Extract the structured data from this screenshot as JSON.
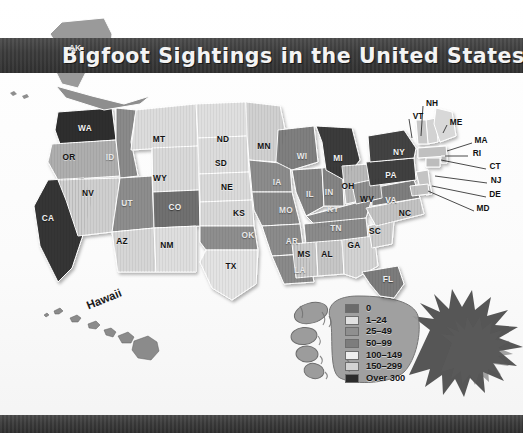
{
  "banner": {
    "title": "Bigfoot Sightings in the United States"
  },
  "insets": {
    "alaska_label": "AK",
    "hawaii_label": "Hawaii"
  },
  "legend": {
    "title": "",
    "items": [
      {
        "label": "0",
        "color": "#6b6b6b"
      },
      {
        "label": "1–24",
        "color": "#e2e2e2"
      },
      {
        "label": "25–49",
        "color": "#8f8f8f"
      },
      {
        "label": "50–99",
        "color": "#7d7d7d"
      },
      {
        "label": "100–149",
        "color": "#efefef"
      },
      {
        "label": "150–299",
        "color": "#d2d2d2"
      },
      {
        "label": "Over 300",
        "color": "#2b2b2b"
      }
    ]
  },
  "chart_data": {
    "type": "map",
    "title": "Bigfoot Sightings in the United States",
    "value_label": "Number of reported Bigfoot sightings",
    "bins": [
      "0",
      "1–24",
      "25–49",
      "50–99",
      "100–149",
      "150–299",
      "Over 300"
    ],
    "bin_colors": [
      "#6b6b6b",
      "#e2e2e2",
      "#8f8f8f",
      "#7d7d7d",
      "#efefef",
      "#d2d2d2",
      "#2b2b2b"
    ],
    "regions": [
      {
        "code": "AK",
        "bin": "25–49",
        "fill": "#9a9a9a",
        "x": 75,
        "y": 48,
        "label_style": "light"
      },
      {
        "code": "WA",
        "bin": "Over 300",
        "fill": "#2f2f2f",
        "x": 85,
        "y": 128,
        "label_style": "light"
      },
      {
        "code": "OR",
        "bin": "150–299",
        "fill": "#aeaeae",
        "x": 69,
        "y": 157,
        "label_style": "dark"
      },
      {
        "code": "CA",
        "bin": "Over 300",
        "fill": "#343434",
        "x": 48,
        "y": 218,
        "label_style": "light"
      },
      {
        "code": "ID",
        "bin": "50–99",
        "fill": "#8a8a8a",
        "x": 110,
        "y": 157,
        "label_style": "mid"
      },
      {
        "code": "NV",
        "bin": "100–149",
        "fill": "#cfcfcf",
        "x": 88,
        "y": 193,
        "label_style": "dark"
      },
      {
        "code": "UT",
        "bin": "50–99",
        "fill": "#8d8d8d",
        "x": 127,
        "y": 203,
        "label_style": "mid"
      },
      {
        "code": "AZ",
        "bin": "100–149",
        "fill": "#d6d6d6",
        "x": 122,
        "y": 241,
        "label_style": "dark"
      },
      {
        "code": "MT",
        "bin": "100–149",
        "fill": "#dcdcdc",
        "x": 159,
        "y": 139,
        "label_style": "dark"
      },
      {
        "code": "WY",
        "bin": "100–149",
        "fill": "#d9d9d9",
        "x": 160,
        "y": 178,
        "label_style": "dark"
      },
      {
        "code": "CO",
        "bin": "50–99",
        "fill": "#6f6f6f",
        "x": 175,
        "y": 207,
        "label_style": "light"
      },
      {
        "code": "NM",
        "bin": "100–149",
        "fill": "#dedede",
        "x": 167,
        "y": 245,
        "label_style": "dark"
      },
      {
        "code": "ND",
        "bin": "100–149",
        "fill": "#dfdfdf",
        "x": 223,
        "y": 139,
        "label_style": "dark"
      },
      {
        "code": "SD",
        "bin": "100–149",
        "fill": "#dcdcdc",
        "x": 221,
        "y": 163,
        "label_style": "dark"
      },
      {
        "code": "NE",
        "bin": "100–149",
        "fill": "#dadada",
        "x": 227,
        "y": 187,
        "label_style": "dark"
      },
      {
        "code": "KS",
        "bin": "100–149",
        "fill": "#d8d8d8",
        "x": 239,
        "y": 213,
        "label_style": "dark"
      },
      {
        "code": "OK",
        "bin": "50–99",
        "fill": "#8e8e8e",
        "x": 248,
        "y": 235,
        "label_style": "mid"
      },
      {
        "code": "TX",
        "bin": "100–149",
        "fill": "#e3e3e3",
        "x": 231,
        "y": 266,
        "label_style": "dark"
      },
      {
        "code": "MN",
        "bin": "100–149",
        "fill": "#d0d0d0",
        "x": 264,
        "y": 146,
        "label_style": "dark"
      },
      {
        "code": "IA",
        "bin": "50–99",
        "fill": "#8c8c8c",
        "x": 277,
        "y": 182,
        "label_style": "mid"
      },
      {
        "code": "MO",
        "bin": "50–99",
        "fill": "#888888",
        "x": 286,
        "y": 210,
        "label_style": "mid"
      },
      {
        "code": "AR",
        "bin": "50–99",
        "fill": "#8b8b8b",
        "x": 292,
        "y": 241,
        "label_style": "mid"
      },
      {
        "code": "LA",
        "bin": "50–99",
        "fill": "#8a8a8a",
        "x": 300,
        "y": 270,
        "label_style": "mid"
      },
      {
        "code": "WI",
        "bin": "50–99",
        "fill": "#7f7f7f",
        "x": 302,
        "y": 156,
        "label_style": "mid"
      },
      {
        "code": "IL",
        "bin": "50–99",
        "fill": "#838383",
        "x": 310,
        "y": 194,
        "label_style": "mid"
      },
      {
        "code": "IN",
        "bin": "50–99",
        "fill": "#848484",
        "x": 329,
        "y": 192,
        "label_style": "mid"
      },
      {
        "code": "MI",
        "bin": "Over 300",
        "fill": "#3a3a3a",
        "x": 338,
        "y": 158,
        "label_style": "light"
      },
      {
        "code": "OH",
        "bin": "150–299",
        "fill": "#b9b9b9",
        "x": 348,
        "y": 186,
        "label_style": "dark"
      },
      {
        "code": "KY",
        "bin": "50–99",
        "fill": "#8c8c8c",
        "x": 333,
        "y": 209,
        "label_style": "mid"
      },
      {
        "code": "TN",
        "bin": "50–99",
        "fill": "#8b8b8b",
        "x": 336,
        "y": 228,
        "label_style": "mid"
      },
      {
        "code": "MS",
        "bin": "100–149",
        "fill": "#c9c9c9",
        "x": 304,
        "y": 254,
        "label_style": "dark"
      },
      {
        "code": "AL",
        "bin": "100–149",
        "fill": "#c6c6c6",
        "x": 327,
        "y": 254,
        "label_style": "dark"
      },
      {
        "code": "GA",
        "bin": "100–149",
        "fill": "#d3d3d3",
        "x": 354,
        "y": 245,
        "label_style": "dark"
      },
      {
        "code": "FL",
        "bin": "50–99",
        "fill": "#7c7c7c",
        "x": 388,
        "y": 279,
        "label_style": "light"
      },
      {
        "code": "SC",
        "bin": "100–149",
        "fill": "#cccccc",
        "x": 375,
        "y": 231,
        "label_style": "dark"
      },
      {
        "code": "NC",
        "bin": "100–149",
        "fill": "#c2c2c2",
        "x": 405,
        "y": 213,
        "label_style": "dark"
      },
      {
        "code": "VA",
        "bin": "50–99",
        "fill": "#7e7e7e",
        "x": 391,
        "y": 200,
        "label_style": "light"
      },
      {
        "code": "WV",
        "bin": "50–99",
        "fill": "#909090",
        "x": 367,
        "y": 199,
        "label_style": "dark"
      },
      {
        "code": "PA",
        "bin": "Over 300",
        "fill": "#3f3f3f",
        "x": 391,
        "y": 175,
        "label_style": "light"
      },
      {
        "code": "NY",
        "bin": "Over 300",
        "fill": "#434343",
        "x": 399,
        "y": 152,
        "label_style": "light"
      }
    ],
    "callouts": [
      {
        "code": "NH",
        "x": 432,
        "y": 103,
        "lx": 421,
        "ly": 136
      },
      {
        "code": "VT",
        "x": 418,
        "y": 116,
        "lx": 412,
        "ly": 138
      },
      {
        "code": "ME",
        "x": 456,
        "y": 122,
        "lx": 443,
        "ly": 133
      },
      {
        "code": "MA",
        "x": 481,
        "y": 140,
        "lx": 447,
        "ly": 151
      },
      {
        "code": "RI",
        "x": 477,
        "y": 153,
        "lx": 445,
        "ly": 156
      },
      {
        "code": "CT",
        "x": 495,
        "y": 166,
        "lx": 441,
        "ly": 160
      },
      {
        "code": "NJ",
        "x": 496,
        "y": 180,
        "lx": 435,
        "ly": 176
      },
      {
        "code": "DE",
        "x": 495,
        "y": 194,
        "lx": 432,
        "ly": 186
      },
      {
        "code": "MD",
        "x": 483,
        "y": 208,
        "lx": 428,
        "ly": 191
      }
    ]
  }
}
